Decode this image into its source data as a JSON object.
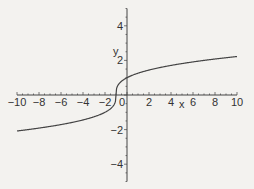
{
  "chart_data": {
    "type": "line",
    "title": "",
    "xlabel": "x",
    "ylabel": "y",
    "xlim": [
      -10,
      10
    ],
    "ylim": [
      -5,
      5
    ],
    "x_ticks": [
      -10,
      -8,
      -6,
      -4,
      -2,
      0,
      2,
      4,
      6,
      8,
      10
    ],
    "x_tick_labels": [
      "−10",
      "−8",
      "−6",
      "−4",
      "−2",
      "0",
      "2",
      "4",
      "6",
      "8",
      "10"
    ],
    "y_ticks": [
      -4,
      -2,
      2,
      4
    ],
    "y_tick_labels": [
      "−4",
      "−2",
      "2",
      "4"
    ],
    "grid": false,
    "legend": null,
    "series": [
      {
        "name": "y = (x+1)^(1/3)",
        "color": "#333333",
        "x": [
          -10,
          -8,
          -6,
          -4,
          -2,
          -1.5,
          -1.1,
          -1,
          -0.9,
          -0.5,
          0,
          2,
          4,
          6,
          8,
          10
        ],
        "y": [
          -2.08,
          -1.91,
          -1.71,
          -1.44,
          -1.0,
          -0.79,
          -0.46,
          0,
          0.46,
          0.79,
          1.0,
          1.44,
          1.71,
          1.91,
          2.08,
          2.22
        ]
      }
    ]
  }
}
